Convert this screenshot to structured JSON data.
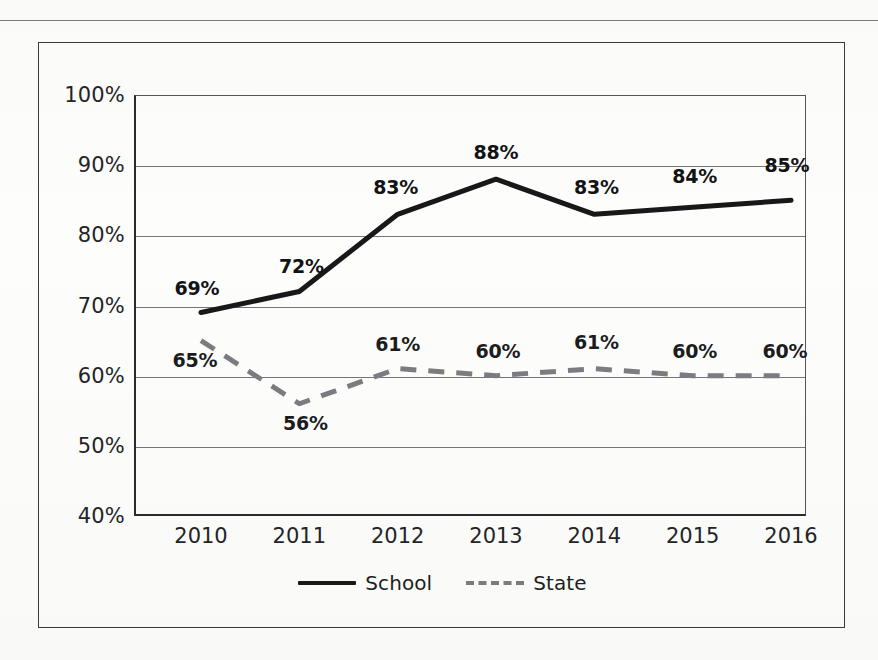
{
  "chart_data": {
    "type": "line",
    "title": "",
    "xlabel": "",
    "ylabel": "",
    "categories": [
      "2010",
      "2011",
      "2012",
      "2013",
      "2014",
      "2015",
      "2016"
    ],
    "ylim": [
      40,
      100
    ],
    "ytick_labels": [
      "100%",
      "90%",
      "80%",
      "70%",
      "60%",
      "50%",
      "40%"
    ],
    "ytick_values": [
      100,
      90,
      80,
      70,
      60,
      50,
      40
    ],
    "grid": true,
    "legend_position": "bottom-center",
    "series": [
      {
        "name": "School",
        "style": "solid",
        "color": "#18181a",
        "values": [
          69,
          72,
          83,
          88,
          83,
          84,
          85
        ],
        "data_labels": [
          "69%",
          "72%",
          "83%",
          "88%",
          "83%",
          "84%",
          "85%"
        ]
      },
      {
        "name": "State",
        "style": "dashed",
        "color": "#7c7c80",
        "values": [
          65,
          56,
          61,
          60,
          61,
          60,
          60
        ],
        "data_labels": [
          "65%",
          "56%",
          "61%",
          "60%",
          "61%",
          "60%",
          "60%"
        ]
      }
    ]
  },
  "legend": {
    "items": [
      {
        "label": "School",
        "swatch": "solid-line-swatch"
      },
      {
        "label": "State",
        "swatch": "dashed-line-swatch"
      }
    ]
  }
}
